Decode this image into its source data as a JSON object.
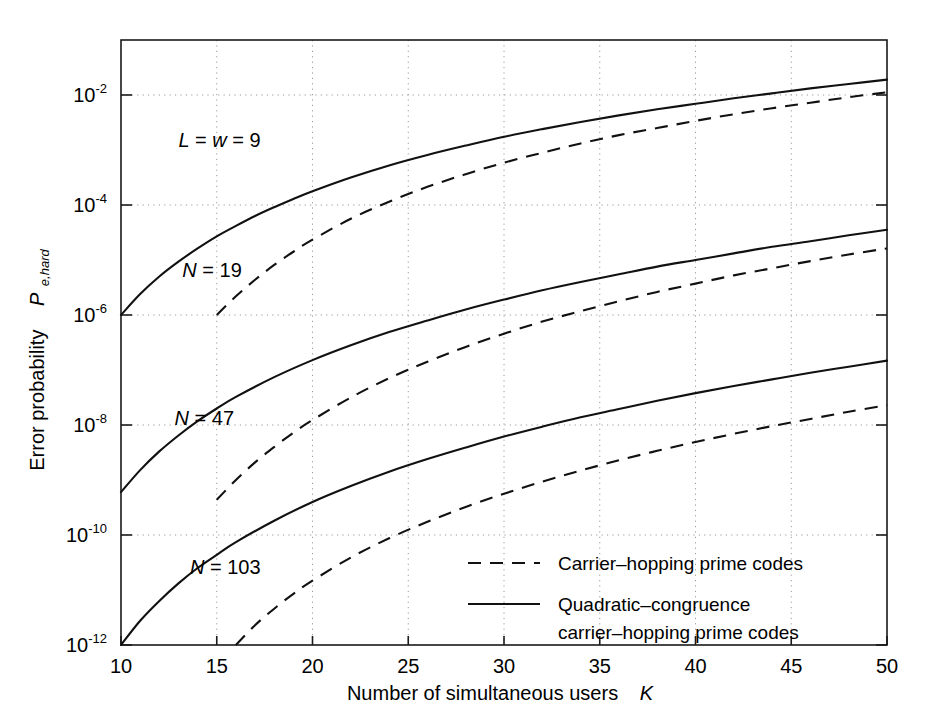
{
  "chart_data": {
    "type": "line",
    "title": "",
    "xlabel": "Number of simultaneous users   K",
    "xlabel_main": "Number of simultaneous users",
    "xlabel_symbol": "K",
    "ylabel_main": "Error probability",
    "ylabel_symbol": "P",
    "ylabel_subscript": "e,hard",
    "xlim": [
      10,
      50
    ],
    "ylim_log10": [
      -12,
      -1
    ],
    "xticks": [
      10,
      15,
      20,
      25,
      30,
      35,
      40,
      45,
      50
    ],
    "xtick_labels": [
      "10",
      "15",
      "20",
      "25",
      "30",
      "35",
      "40",
      "45",
      "50"
    ],
    "yticks_log10": [
      -2,
      -4,
      -6,
      -8,
      -10,
      -12
    ],
    "ytick_labels": [
      "10",
      "10",
      "10",
      "10",
      "10",
      "10"
    ],
    "ytick_exponents": [
      "-2",
      "-4",
      "-6",
      "-8",
      "-10",
      "-12"
    ],
    "grid": true,
    "grid_style": "dotted",
    "legend_position": "bottom-right-inside",
    "annotations": [
      {
        "name": "parameters",
        "text_parts": [
          "L",
          " = ",
          "w",
          " = 9"
        ],
        "text": "L = w = 9",
        "x": 13.0,
        "y_log10": -2.95
      },
      {
        "name": "n-19",
        "text_parts": [
          "N",
          " = 19"
        ],
        "text": "N = 19",
        "x": 13.2,
        "y_log10": -5.3
      },
      {
        "name": "n-47",
        "text_parts": [
          "N",
          " = 47"
        ],
        "text": "N = 47",
        "x": 12.8,
        "y_log10": -8.0
      },
      {
        "name": "n-103",
        "text_parts": [
          "N",
          " = 103"
        ],
        "text": "N = 103",
        "x": 13.6,
        "y_log10": -10.7
      }
    ],
    "series": [
      {
        "name": "Quadratic-congruence carrier-hopping prime codes, N = 19",
        "style": "solid",
        "N": 19,
        "x": [
          10,
          11,
          12,
          13,
          14,
          15,
          16,
          17,
          18,
          19,
          20,
          22,
          24,
          26,
          28,
          30,
          32,
          34,
          36,
          38,
          40,
          42,
          44,
          46,
          48,
          50
        ],
        "y_log10": [
          -6.0,
          -5.62,
          -5.3,
          -5.03,
          -4.79,
          -4.57,
          -4.38,
          -4.2,
          -4.04,
          -3.89,
          -3.75,
          -3.5,
          -3.28,
          -3.09,
          -2.92,
          -2.76,
          -2.62,
          -2.49,
          -2.37,
          -2.26,
          -2.16,
          -2.06,
          -1.97,
          -1.88,
          -1.8,
          -1.72
        ]
      },
      {
        "name": "Carrier-hopping prime codes, N = 19",
        "style": "dashed",
        "N": 19,
        "x": [
          15,
          16,
          17,
          18,
          19,
          20,
          22,
          24,
          26,
          28,
          30,
          32,
          34,
          36,
          38,
          40,
          42,
          44,
          46,
          48,
          50
        ],
        "y_log10": [
          -6.0,
          -5.66,
          -5.36,
          -5.09,
          -4.85,
          -4.63,
          -4.25,
          -3.94,
          -3.67,
          -3.44,
          -3.23,
          -3.05,
          -2.88,
          -2.73,
          -2.6,
          -2.47,
          -2.35,
          -2.24,
          -2.14,
          -2.04,
          -1.95
        ]
      },
      {
        "name": "Quadratic-congruence carrier-hopping prime codes, N = 47",
        "style": "solid",
        "N": 47,
        "x": [
          10,
          11,
          12,
          13,
          14,
          15,
          16,
          18,
          20,
          22,
          24,
          26,
          28,
          30,
          32,
          34,
          36,
          38,
          40,
          42,
          44,
          46,
          48,
          50
        ],
        "y_log10": [
          -9.22,
          -8.82,
          -8.48,
          -8.19,
          -7.93,
          -7.7,
          -7.49,
          -7.13,
          -6.82,
          -6.55,
          -6.31,
          -6.1,
          -5.9,
          -5.72,
          -5.55,
          -5.4,
          -5.26,
          -5.12,
          -5.0,
          -4.88,
          -4.76,
          -4.66,
          -4.55,
          -4.45
        ]
      },
      {
        "name": "Carrier-hopping prime codes, N = 47",
        "style": "dashed",
        "N": 47,
        "x": [
          15,
          16,
          17,
          18,
          19,
          20,
          22,
          24,
          26,
          28,
          30,
          32,
          34,
          36,
          38,
          40,
          42,
          44,
          46,
          48,
          50
        ],
        "y_log10": [
          -9.36,
          -9.0,
          -8.68,
          -8.4,
          -8.14,
          -7.91,
          -7.5,
          -7.15,
          -6.85,
          -6.58,
          -6.34,
          -6.12,
          -5.93,
          -5.75,
          -5.58,
          -5.43,
          -5.28,
          -5.15,
          -5.02,
          -4.9,
          -4.79
        ]
      },
      {
        "name": "Quadratic-congruence carrier-hopping prime codes, N = 103",
        "style": "solid",
        "N": 103,
        "x": [
          10,
          11,
          12,
          13,
          14,
          15,
          16,
          18,
          20,
          22,
          24,
          26,
          28,
          30,
          32,
          34,
          36,
          38,
          40,
          42,
          44,
          46,
          48,
          50
        ],
        "y_log10": [
          -12.0,
          -11.56,
          -11.2,
          -10.88,
          -10.6,
          -10.36,
          -10.13,
          -9.74,
          -9.4,
          -9.11,
          -8.85,
          -8.62,
          -8.41,
          -8.21,
          -8.03,
          -7.86,
          -7.71,
          -7.56,
          -7.42,
          -7.29,
          -7.17,
          -7.05,
          -6.94,
          -6.83
        ]
      },
      {
        "name": "Carrier-hopping prime codes, N = 103",
        "style": "dashed",
        "N": 103,
        "x": [
          16,
          17,
          18,
          19,
          20,
          22,
          24,
          26,
          28,
          30,
          32,
          34,
          36,
          38,
          40,
          42,
          44,
          46,
          48,
          50
        ],
        "y_log10": [
          -12.0,
          -11.64,
          -11.34,
          -11.07,
          -10.83,
          -10.41,
          -10.06,
          -9.76,
          -9.49,
          -9.25,
          -9.03,
          -8.83,
          -8.64,
          -8.47,
          -8.31,
          -8.16,
          -8.02,
          -7.89,
          -7.76,
          -7.64
        ]
      }
    ],
    "legend": [
      {
        "label": "Carrier–hopping prime codes",
        "style": "dashed"
      },
      {
        "label": "Quadratic–congruence",
        "label2": "carrier–hopping prime codes",
        "style": "solid"
      }
    ]
  },
  "legend_entries": {
    "dashed_label": "Carrier–hopping prime codes",
    "solid_label_line1": "Quadratic–congruence",
    "solid_label_line2": "carrier–hopping prime codes"
  },
  "axes": {
    "x_title_main": "Number of simultaneous users",
    "x_title_symbol": "K",
    "y_title_main": "Error probability",
    "y_title_symbol": "P",
    "y_title_sub": "e,hard"
  }
}
